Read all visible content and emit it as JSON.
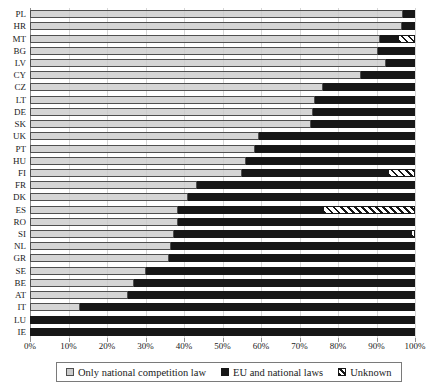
{
  "chart_data": {
    "type": "bar",
    "orientation": "horizontal",
    "stacked": true,
    "grid": true,
    "title": "",
    "xlabel": "",
    "ylabel": "",
    "categories": [
      "PL",
      "HR",
      "MT",
      "BG",
      "LV",
      "CY",
      "CZ",
      "LT",
      "DE",
      "SK",
      "UK",
      "PT",
      "HU",
      "FI",
      "FR",
      "DK",
      "ES",
      "RO",
      "SI",
      "NL",
      "GR",
      "SE",
      "BE",
      "AT",
      "IT",
      "LU",
      "IE"
    ],
    "series": [
      {
        "name": "Only national competition law",
        "color": "#cbcbcb",
        "pattern": "solid",
        "values": [
          97,
          96.5,
          91,
          90.5,
          92.5,
          86,
          76,
          74,
          73.5,
          73,
          59.5,
          58.5,
          56,
          55,
          43.5,
          41,
          38.5,
          38.5,
          37.5,
          36.5,
          36,
          30,
          27,
          25.5,
          13,
          0,
          0
        ]
      },
      {
        "name": "EU and national laws",
        "color": "#171717",
        "pattern": "solid",
        "values": [
          3,
          3.5,
          4.5,
          9.5,
          7.5,
          14,
          24,
          26,
          26.5,
          27,
          40.5,
          41.5,
          44,
          38,
          56.5,
          59,
          37.5,
          61.5,
          61.5,
          63.5,
          64,
          70,
          73,
          74.5,
          87,
          100,
          100
        ]
      },
      {
        "name": "Unknown",
        "color": "#171717",
        "pattern": "diagonal-hatch",
        "values": [
          0,
          0,
          4.5,
          0,
          0,
          0,
          0,
          0,
          0,
          0,
          0,
          0,
          0,
          7,
          0,
          0,
          24,
          0,
          1,
          0,
          0,
          0,
          0,
          0,
          0,
          0,
          0
        ]
      }
    ],
    "x_axis": {
      "min": 0,
      "max": 100,
      "tick_labels": [
        "0%",
        "10%",
        "20%",
        "30%",
        "40%",
        "50%",
        "60%",
        "70%",
        "80%",
        "90%",
        "100%"
      ],
      "tick_values": [
        0,
        10,
        20,
        30,
        40,
        50,
        60,
        70,
        80,
        90,
        100
      ]
    },
    "legend": {
      "position": "bottom",
      "entries": [
        "Only national competition law",
        "EU and national laws",
        "Unknown"
      ]
    }
  },
  "colors": {
    "background": "#ffffff",
    "gridline": "#d6d6d6",
    "axis": "#8f8f8f",
    "bar_gray": "#cbcbcb",
    "bar_black": "#171717",
    "text": "#1a1a1a"
  }
}
